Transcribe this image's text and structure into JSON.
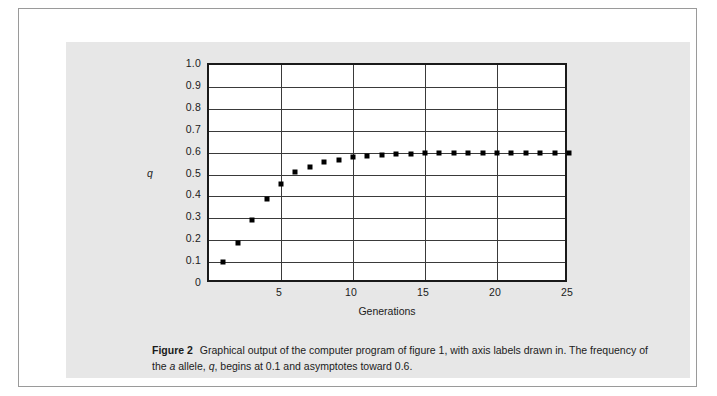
{
  "figure": {
    "caption_label": "Figure 2",
    "caption_text_part1": "Graphical output of the computer program of figure 1, with axis labels drawn in. The frequency of the ",
    "caption_italic_a": "a",
    "caption_text_part2": " allele, ",
    "caption_italic_q": "q",
    "caption_text_part3": ", begins at 0.1 and asymptotes toward 0.6.",
    "panel_color": "#e7e7e7",
    "frame_border_color": "#9a9a9a"
  },
  "chart_data": {
    "type": "scatter",
    "title": "",
    "xlabel": "Generations",
    "ylabel": "q",
    "xlim": [
      0,
      25
    ],
    "ylim": [
      0,
      1.0
    ],
    "grid": true,
    "legend": "none",
    "marker": "square",
    "marker_color": "#000000",
    "plot_border_color": "#1a1a1a",
    "gridline_color": "#3a3a3a",
    "y_ticks": [
      "1.0",
      "0.9",
      "0.8",
      "0.7",
      "0.6",
      "0.5",
      "0.4",
      "0.3",
      "0.2",
      "0.1",
      "0"
    ],
    "y_tick_values": [
      1.0,
      0.9,
      0.8,
      0.7,
      0.6,
      0.5,
      0.4,
      0.3,
      0.2,
      0.1,
      0
    ],
    "x_ticks": [
      "5",
      "10",
      "15",
      "20",
      "25"
    ],
    "x_tick_values": [
      5,
      10,
      15,
      20,
      25
    ],
    "x_gridline_values": [
      5,
      10,
      15,
      20
    ],
    "x": [
      1,
      2,
      3,
      4,
      5,
      6,
      7,
      8,
      9,
      10,
      11,
      12,
      13,
      14,
      15,
      16,
      17,
      18,
      19,
      20,
      21,
      22,
      23,
      24,
      25
    ],
    "values": [
      0.1,
      0.185,
      0.29,
      0.39,
      0.455,
      0.51,
      0.535,
      0.555,
      0.568,
      0.578,
      0.585,
      0.59,
      0.593,
      0.595,
      0.597,
      0.598,
      0.599,
      0.599,
      0.6,
      0.6,
      0.6,
      0.6,
      0.6,
      0.6,
      0.6
    ],
    "series": [
      {
        "name": "q (frequency of a allele)",
        "values": [
          0.1,
          0.185,
          0.29,
          0.39,
          0.455,
          0.51,
          0.535,
          0.555,
          0.568,
          0.578,
          0.585,
          0.59,
          0.593,
          0.595,
          0.597,
          0.598,
          0.599,
          0.599,
          0.6,
          0.6,
          0.6,
          0.6,
          0.6,
          0.6,
          0.6
        ]
      }
    ]
  }
}
